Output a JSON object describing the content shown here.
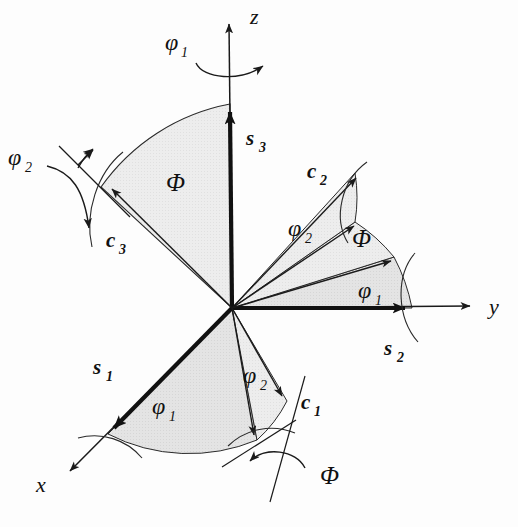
{
  "figure": {
    "background_color": "#fdfdfd",
    "stroke_color": "#1a1a1a",
    "sector_fill_light": "#ededed",
    "sector_fill_mid": "#e2e2e2",
    "origin": {
      "x": 232,
      "y": 308
    }
  },
  "axes": [
    {
      "id": "z",
      "label": "z",
      "label_x": 250,
      "label_y": 24,
      "tip": {
        "x": 229,
        "y": 18
      },
      "label_interactable": false
    },
    {
      "id": "y",
      "label": "y",
      "label_x": 489,
      "label_y": 314,
      "tip": {
        "x": 474,
        "y": 306
      },
      "label_interactable": false
    },
    {
      "id": "x",
      "label": "x",
      "label_x": 36,
      "label_y": 492,
      "tip": {
        "x": 66,
        "y": 474
      },
      "label_interactable": false
    }
  ],
  "sample_vectors": [
    {
      "id": "s1",
      "base": "s",
      "sub": "1",
      "label_x": 93,
      "label_y": 374
    },
    {
      "id": "s2",
      "base": "s",
      "sub": "2",
      "label_x": 384,
      "label_y": 355
    },
    {
      "id": "s3",
      "base": "s",
      "sub": "3",
      "label_x": 246,
      "label_y": 145
    }
  ],
  "crystal_vectors": [
    {
      "id": "c1",
      "base": "c",
      "sub": "1",
      "label_x": 301,
      "label_y": 409
    },
    {
      "id": "c2",
      "base": "c",
      "sub": "2",
      "label_x": 307,
      "label_y": 178
    },
    {
      "id": "c3",
      "base": "c",
      "sub": "3",
      "label_x": 106,
      "label_y": 247
    }
  ],
  "angle_labels": [
    {
      "id": "phi1-top",
      "base": "φ",
      "sub": "1",
      "x": 175,
      "y": 50,
      "note": "rotation about z"
    },
    {
      "id": "phi2-left",
      "base": "φ",
      "sub": "2",
      "x": 14,
      "y": 165,
      "note": "rotation about c3"
    },
    {
      "id": "phi2-right",
      "base": "φ",
      "sub": "2",
      "x": 295,
      "y": 236,
      "note": "sector c2 to intermediate"
    },
    {
      "id": "phi1-right",
      "base": "φ",
      "sub": "1",
      "x": 364,
      "y": 298,
      "note": "sector s2 to intermediate"
    },
    {
      "id": "phi1-bottom",
      "base": "φ",
      "sub": "1",
      "x": 158,
      "y": 414,
      "note": "sector s1 to intermediate"
    },
    {
      "id": "phi2-bottom",
      "base": "φ",
      "sub": "2",
      "x": 249,
      "y": 383,
      "note": "sector intermediate to c1"
    }
  ],
  "capital_phi_labels": [
    {
      "id": "Phi-upper-left",
      "text": "Φ",
      "x": 166,
      "y": 191,
      "note": "angle between s3 and c3"
    },
    {
      "id": "Phi-right",
      "text": "Φ",
      "x": 352,
      "y": 247,
      "note": "angle in y-c2 fan"
    },
    {
      "id": "Phi-bottom",
      "text": "Φ",
      "x": 320,
      "y": 484,
      "note": "rotation about c1 line"
    }
  ],
  "rotation_arrows": [
    {
      "id": "rot-phi1-z",
      "about": "z",
      "label": "φ₁"
    },
    {
      "id": "rot-phi2-c3",
      "about": "c3",
      "label": "φ₂"
    },
    {
      "id": "rot-Phi-c1",
      "about": "c1",
      "label": "Φ"
    }
  ]
}
